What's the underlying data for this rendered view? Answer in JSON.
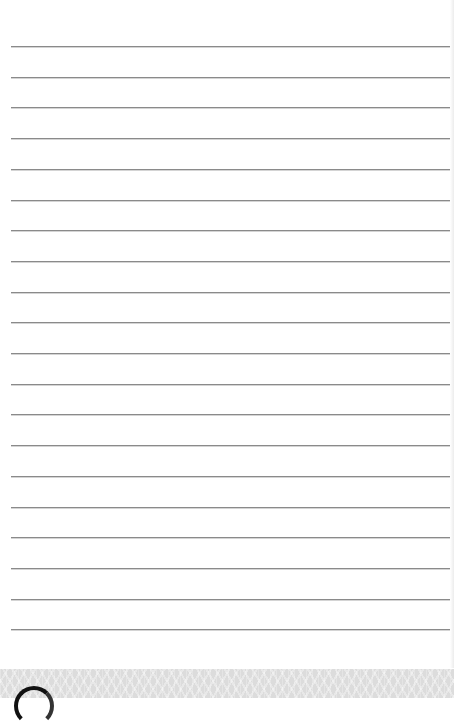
{
  "page": {
    "type": "lined-paper",
    "line_count": 20,
    "first_line_y": 46,
    "line_spacing": 30.7,
    "line_color": "#8a8a8a",
    "background_color": "#ffffff"
  },
  "footer": {
    "band_color": "#dcdcdc",
    "logo_icon": "circle-logo-icon"
  }
}
